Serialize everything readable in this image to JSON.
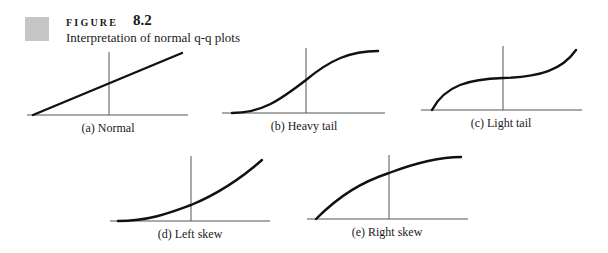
{
  "figure": {
    "label": "FIGURE",
    "number": "8.2",
    "caption": "Interpretation of normal q-q plots",
    "swatch_color": "#c6c6c6"
  },
  "plots": [
    {
      "id": "a",
      "label": "(a) Normal",
      "shape": "linear"
    },
    {
      "id": "b",
      "label": "(b) Heavy tail",
      "shape": "s-curve"
    },
    {
      "id": "c",
      "label": "(c) Light tail",
      "shape": "inverse-s-curve"
    },
    {
      "id": "d",
      "label": "(d) Left skew",
      "shape": "convex"
    },
    {
      "id": "e",
      "label": "(e) Right skew",
      "shape": "concave"
    }
  ]
}
